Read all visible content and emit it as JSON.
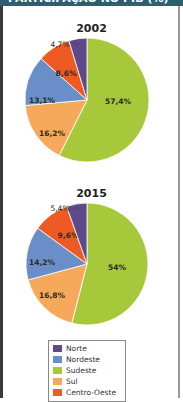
{
  "header": {
    "title": "PARTICIPAÇÃO NO PIB (%)"
  },
  "colors": {
    "Norte": "#5e4a8a",
    "Nordeste": "#6a8fc8",
    "Sudeste": "#a6c83a",
    "Sul": "#f6a95a",
    "Centro-Oeste": "#ee5a24"
  },
  "legend": [
    {
      "label": "Norte",
      "color": "#5e4a8a"
    },
    {
      "label": "Nordeste",
      "color": "#6a8fc8"
    },
    {
      "label": "Sudeste",
      "color": "#a6c83a"
    },
    {
      "label": "Sul",
      "color": "#f6a95a"
    },
    {
      "label": "Centro-Oeste",
      "color": "#ee5a24"
    }
  ],
  "chart_data": [
    {
      "type": "pie",
      "title": "2002",
      "categories": [
        "Sudeste",
        "Sul",
        "Nordeste",
        "Centro-Oeste",
        "Norte"
      ],
      "values": [
        57.4,
        16.2,
        13.1,
        8.6,
        4.7
      ],
      "labels": [
        "57,4%",
        "16,2%",
        "13,1%",
        "8,6%",
        "4,7%"
      ],
      "start_angle": "12 o'clock, clockwise"
    },
    {
      "type": "pie",
      "title": "2015",
      "categories": [
        "Sudeste",
        "Sul",
        "Nordeste",
        "Centro-Oeste",
        "Norte"
      ],
      "values": [
        54,
        16.8,
        14.2,
        9.6,
        5.4
      ],
      "labels": [
        "54%",
        "16,8%",
        "14,2%",
        "9,6%",
        "5,4%"
      ],
      "start_angle": "12 o'clock, clockwise"
    }
  ]
}
